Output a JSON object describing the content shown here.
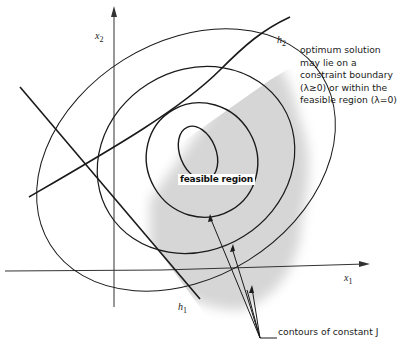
{
  "diagram": {
    "type": "constrained optimization contour plot",
    "axes": {
      "x_label": "x",
      "x_sub": "1",
      "y_label": "x",
      "y_sub": "2"
    },
    "constraints": [
      {
        "name": "h",
        "sub": "1"
      },
      {
        "name": "h",
        "sub": "2"
      }
    ],
    "region_label": "feasible region",
    "annotation_lines": [
      "optimum solution",
      "may lie on a",
      "constraint boundary",
      "(λ≥0) or within the",
      "feasible  region (λ=0)"
    ],
    "contours_label": "contours of constant J",
    "colors": {
      "line": "#1a1a1a",
      "shade": "#d9d9d9",
      "background": "#ffffff"
    }
  }
}
